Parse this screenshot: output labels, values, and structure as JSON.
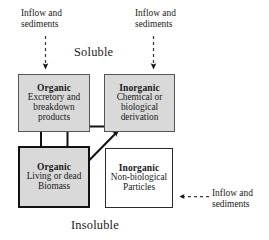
{
  "diagram": {
    "title_top": "Soluble",
    "title_bottom": "Insoluble",
    "boxes": [
      {
        "id": "organic-soluble",
        "title": "Organic",
        "body_lines": [
          "Excretory and",
          "breakdown",
          "products"
        ],
        "fill": "#d9d9d9",
        "border": "#555555",
        "phase": "Soluble"
      },
      {
        "id": "inorganic-soluble",
        "title": "Inorganic",
        "body_lines": [
          "Chemical or",
          "biological",
          "derivation"
        ],
        "fill": "#d9d9d9",
        "border": "#555555",
        "phase": "Soluble"
      },
      {
        "id": "organic-insoluble",
        "title": "Organic",
        "body_lines": [
          "Living or dead",
          "Biomass"
        ],
        "fill": "#d9d9d9",
        "border": "#111111",
        "phase": "Insoluble"
      },
      {
        "id": "inorganic-insoluble",
        "title": "Inorganic",
        "body_lines": [
          "Non-biological",
          "Particles"
        ],
        "fill": "#ffffff",
        "border": "#2b2b2b",
        "phase": "Insoluble"
      }
    ],
    "inflow_labels": [
      {
        "id": "top-left",
        "line1": "Inflow and",
        "line2": "sediments"
      },
      {
        "id": "top-right",
        "line1": "Inflow and",
        "line2": "sediments"
      },
      {
        "id": "right",
        "line1": "Inflow and",
        "line2": "sediments"
      }
    ],
    "arrows": [
      {
        "id": "inflow-into-organic-soluble",
        "style": "dashed",
        "direction": "down",
        "from": "inflow top-left label",
        "to": "Organic (Excretory and breakdown products)"
      },
      {
        "id": "inflow-into-inorganic-soluble",
        "style": "dashed",
        "direction": "down",
        "from": "inflow top-right label",
        "to": "Inorganic (Chemical or biological derivation)"
      },
      {
        "id": "inflow-into-inorganic-insol",
        "style": "dashed",
        "direction": "left",
        "from": "inflow right label",
        "to": "Inorganic (Non-biological Particles)"
      },
      {
        "id": "organic-sol-to-inorganic-sol",
        "style": "solid",
        "direction": "right",
        "from": "Organic (Excretory and breakdown products)",
        "to": "Inorganic (Chemical or biological derivation)"
      },
      {
        "id": "organic-sol-to-organic-insol",
        "style": "solid",
        "direction": "down",
        "from": "Organic (Excretory and breakdown products)",
        "to": "Organic (Living or dead Biomass)"
      },
      {
        "id": "organic-insol-to-organic-sol",
        "style": "solid",
        "direction": "up",
        "from": "Organic (Living or dead Biomass)",
        "to": "Organic (Excretory and breakdown products)"
      },
      {
        "id": "organic-insol-inorganic-sol",
        "style": "solid",
        "direction": "both",
        "from": "Organic (Living or dead Biomass)",
        "to": "Inorganic (Chemical or biological derivation)"
      }
    ],
    "colors": {
      "box_fill_gray": "#d9d9d9",
      "box_fill_white": "#ffffff",
      "stroke": "#111111",
      "text": "#1a1a1a"
    }
  }
}
